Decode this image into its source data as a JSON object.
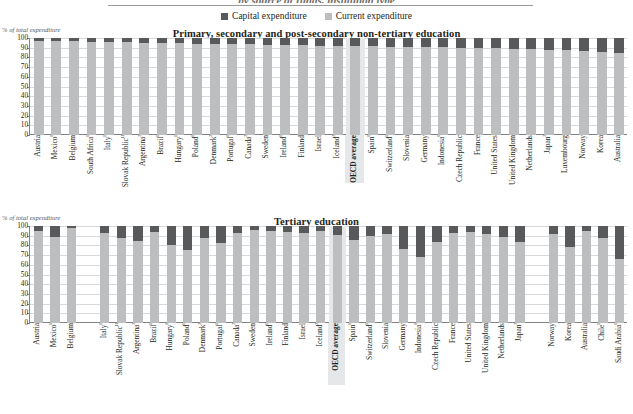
{
  "figure": {
    "top_title": "by source of funds, institution type",
    "legend": [
      {
        "label": "Capital expenditure",
        "color": "#58595b"
      },
      {
        "label": "Current expenditure",
        "color": "#bcbec0"
      }
    ]
  },
  "chart_data": [
    {
      "type": "bar",
      "title": "Primary, secondary and post-secondary non-tertiary education",
      "subtype": "stacked-percent",
      "ylabel": "% of total expenditure",
      "xlabel": "",
      "ylim": [
        0,
        100
      ],
      "yticks": [
        0,
        10,
        20,
        30,
        40,
        50,
        60,
        70,
        80,
        90,
        100
      ],
      "grid": true,
      "legend_position": "top-center",
      "series": [
        {
          "name": "Current expenditure",
          "color": "#bcbec0"
        },
        {
          "name": "Capital expenditure",
          "color": "#58595b"
        }
      ],
      "categories": [
        "Austria",
        "Mexico¹",
        "Belgium",
        "South Africa¹",
        "Italy¹",
        "Slovak Republic¹²",
        "Argentina²",
        "Brazil¹",
        "Hungary¹",
        "Poland¹",
        "Denmark²",
        "Portugal¹",
        "Canada²",
        "Sweden",
        "Ireland¹",
        "Finland",
        "Israel",
        "Iceland²",
        "OECD average",
        "Spain¹",
        "Switzerland¹",
        "Slovenia",
        "Germany",
        "Indonesia¹",
        "Czech Republic",
        "France",
        "United States",
        "United Kingdom",
        "Netherlands",
        "Japan²",
        "Luxembourg",
        "Norway",
        "Korea",
        "Australia"
      ],
      "values": {
        "Current expenditure": [
          97.2,
          96.8,
          96.5,
          96.3,
          96.0,
          95.6,
          95.2,
          94.9,
          94.5,
          94.3,
          94.0,
          93.7,
          93.4,
          93.1,
          92.8,
          92.5,
          92.2,
          92.0,
          91.8,
          91.5,
          91.2,
          91.0,
          90.6,
          90.3,
          90.0,
          89.6,
          89.2,
          88.8,
          88.4,
          88.0,
          87.4,
          86.8,
          86.0,
          85.0
        ],
        "Capital expenditure": [
          2.8,
          3.2,
          3.5,
          3.7,
          4.0,
          4.4,
          4.8,
          5.1,
          5.5,
          5.7,
          6.0,
          6.3,
          6.6,
          6.9,
          7.2,
          7.5,
          7.8,
          8.0,
          8.2,
          8.5,
          8.8,
          9.0,
          9.4,
          9.7,
          10.0,
          10.4,
          10.8,
          11.2,
          11.6,
          12.0,
          12.6,
          13.2,
          14.0,
          15.0
        ]
      },
      "highlight_category": "OECD average"
    },
    {
      "type": "bar",
      "title": "Tertiary education",
      "subtype": "stacked-percent",
      "ylabel": "% of total expenditure",
      "xlabel": "",
      "ylim": [
        0,
        100
      ],
      "yticks": [
        0,
        10,
        20,
        30,
        40,
        50,
        60,
        70,
        80,
        90,
        100
      ],
      "grid": true,
      "legend_position": "top-center",
      "series": [
        {
          "name": "Current expenditure",
          "color": "#bcbec0"
        },
        {
          "name": "Capital expenditure",
          "color": "#58595b"
        }
      ],
      "categories": [
        "Austria",
        "Mexico¹",
        "Belgium",
        "",
        "Italy¹",
        "Slovak Republic¹²",
        "Argentina²",
        "Brazil¹",
        "Hungary¹",
        "Poland¹",
        "Denmark²",
        "Portugal¹",
        "Canada²",
        "Sweden",
        "Ireland¹",
        "Finland",
        "Israel",
        "Iceland²",
        "OECD average",
        "Spain¹",
        "Switzerland¹",
        "Slovenia",
        "Germany",
        "Indonesia¹",
        "Czech Republic",
        "France",
        "United States",
        "United Kingdom",
        "Netherlands",
        "Japan²",
        "",
        "Norway",
        "Korea",
        "Australia",
        "Chile¹",
        "Saudi Arabia¹"
      ],
      "values": {
        "Current expenditure": [
          95.0,
          89.0,
          98.0,
          null,
          93.0,
          88.0,
          85.0,
          94.0,
          80.0,
          75.0,
          88.0,
          82.0,
          93.0,
          96.0,
          95.0,
          94.0,
          93.0,
          95.0,
          91.0,
          86.0,
          90.0,
          92.0,
          76.0,
          68.0,
          84.0,
          93.0,
          94.0,
          92.0,
          89.0,
          84.0,
          null,
          92.0,
          78.0,
          95.0,
          88.0,
          66.0
        ],
        "Capital expenditure": [
          5.0,
          11.0,
          2.0,
          null,
          7.0,
          12.0,
          15.0,
          6.0,
          20.0,
          25.0,
          12.0,
          18.0,
          7.0,
          4.0,
          5.0,
          6.0,
          7.0,
          5.0,
          9.0,
          14.0,
          10.0,
          8.0,
          24.0,
          32.0,
          16.0,
          7.0,
          6.0,
          8.0,
          11.0,
          16.0,
          null,
          8.0,
          22.0,
          5.0,
          12.0,
          34.0
        ]
      },
      "highlight_category": "OECD average"
    }
  ]
}
